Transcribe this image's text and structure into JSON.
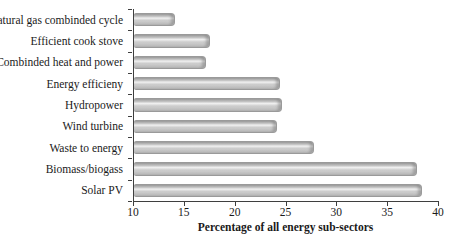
{
  "figure": {
    "background": "#ffffff",
    "text_color": "#1a1a1a",
    "axis_color": "#3f3f3f"
  },
  "chart_data": {
    "type": "bar",
    "orientation": "horizontal",
    "title": "",
    "xlabel": "Percentage of all energy sub-sectors",
    "ylabel": "",
    "categories": [
      "Natural gas combinded cycle",
      "Efficient cook stove",
      "Combinded heat and power",
      "Energy efficieny",
      "Hydropower",
      "Wind turbine",
      "Waste to energy",
      "Biomass/biogass",
      "Solar PV"
    ],
    "values": [
      14,
      17.5,
      17.1,
      24.4,
      24.6,
      24.1,
      27.7,
      37.8,
      38.3
    ],
    "xlim": [
      10,
      40
    ],
    "xticks": [
      10,
      15,
      20,
      25,
      30,
      35,
      40
    ],
    "grid": false,
    "legend": false,
    "bar_color": "#c8c8c8",
    "bar_highlight": "#f0f0f0",
    "bar_border_color": "#9a9a9a"
  }
}
